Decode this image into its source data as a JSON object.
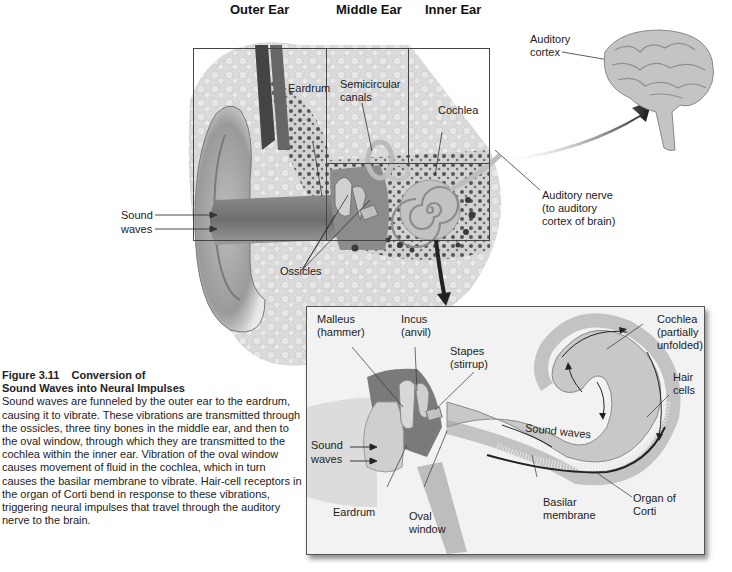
{
  "diagram": {
    "section_headers": [
      "Outer Ear",
      "Middle Ear",
      "Inner Ear"
    ],
    "main_labels": {
      "eardrum": "Eardrum",
      "semicircular_canals": [
        "Semicircular",
        "canals"
      ],
      "cochlea": "Cochlea",
      "sound_waves": [
        "Sound",
        "waves"
      ],
      "ossicles": "Ossicles",
      "auditory_cortex": [
        "Auditory",
        "cortex"
      ],
      "auditory_nerve": [
        "Auditory nerve",
        "(to auditory",
        "cortex of brain)"
      ]
    },
    "inset_labels": {
      "malleus": [
        "Malleus",
        "(hammer)"
      ],
      "incus": [
        "Incus",
        "(anvil)"
      ],
      "stapes": [
        "Stapes",
        "(stirrup)"
      ],
      "cochlea": [
        "Cochlea",
        "(partially",
        "unfolded)"
      ],
      "hair_cells": [
        "Hair",
        "cells"
      ],
      "sound_waves_left": [
        "Sound",
        "waves"
      ],
      "sound_waves_inner": "Sound waves",
      "eardrum": "Eardrum",
      "oval_window": [
        "Oval",
        "window"
      ],
      "basilar_membrane": [
        "Basilar",
        "membrane"
      ],
      "organ_of_corti": [
        "Organ of",
        "Corti"
      ]
    }
  },
  "caption": {
    "figure_number": "Figure 3.11",
    "title_line1": "Conversion of",
    "title_line2": "Sound Waves into Neural Impulses",
    "body": "Sound waves are funneled by the outer ear to the eardrum, causing it to vibrate. These vibrations are transmitted through the ossicles, three tiny bones in the middle ear, and then to the oval window, through which they are transmitted to the cochlea within the inner ear. Vibration of the oval window causes movement of fluid in the cochlea, which in turn causes the basilar membrane to vibrate. Hair-cell receptors in the organ of Corti bend in response to these vibrations, triggering neural impulses that travel through the auditory nerve to the brain."
  },
  "colors": {
    "tissue_light": "#d9d9d9",
    "tissue_mid": "#a8a8a8",
    "tissue_dark": "#5a5a5a",
    "frame_line": "#333333",
    "inset_bg": "#f2f2f2"
  }
}
